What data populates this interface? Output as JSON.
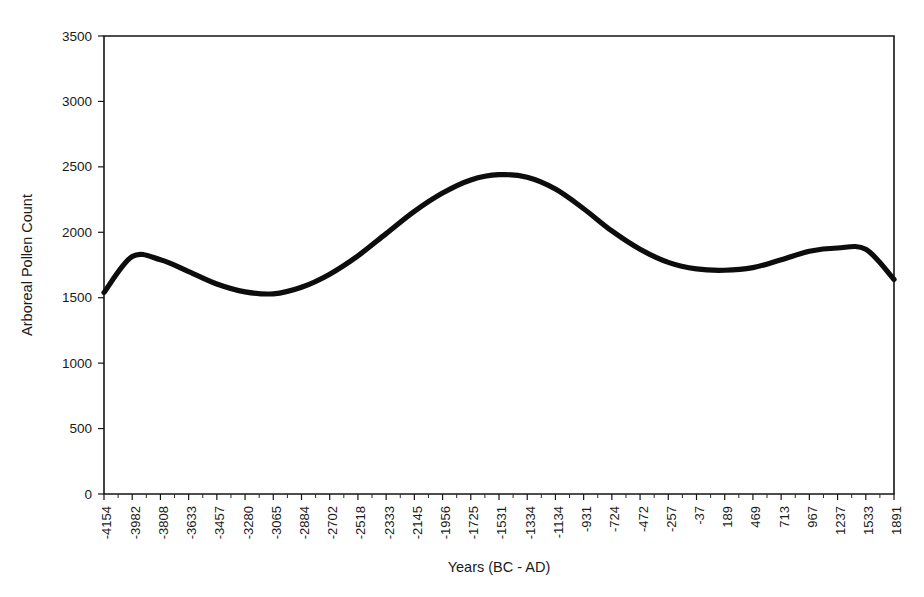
{
  "chart_data": {
    "type": "line",
    "title": "",
    "xlabel": "Years (BC - AD)",
    "ylabel": "Arboreal Pollen Count",
    "grid": false,
    "legend": "none",
    "ylim": [
      0,
      3500
    ],
    "yticks": [
      0,
      500,
      1000,
      1500,
      2000,
      2500,
      3000,
      3500
    ],
    "ytick_labels": [
      "0",
      "500",
      "1000",
      "1500",
      "2000",
      "2500",
      "3000",
      "3500"
    ],
    "categories": [
      "-4154",
      "-3982",
      "-3808",
      "-3633",
      "-3457",
      "-3280",
      "-3065",
      "-2884",
      "-2702",
      "-2518",
      "-2333",
      "-2145",
      "-1956",
      "-1725",
      "-1531",
      "-1334",
      "-1134",
      "-931",
      "-724",
      "-472",
      "-257",
      "-37",
      "189",
      "469",
      "713",
      "967",
      "1237",
      "1533",
      "1891"
    ],
    "values": [
      1540,
      1815,
      1790,
      1700,
      1605,
      1545,
      1530,
      1580,
      1680,
      1820,
      1990,
      2160,
      2300,
      2400,
      2440,
      2420,
      2330,
      2180,
      2010,
      1870,
      1770,
      1720,
      1710,
      1730,
      1790,
      1855,
      1880,
      1870,
      1640
    ],
    "series_color": "#0d0d0d",
    "axis_color": "#151515",
    "background": "#ffffff"
  },
  "layout": {
    "plot_left": 104,
    "plot_right": 894,
    "plot_top": 36,
    "plot_bottom": 494
  }
}
